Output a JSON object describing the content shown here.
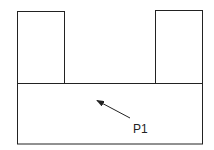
{
  "diagram": {
    "label": "P1",
    "stroke_color": "#222222",
    "shapes": {
      "left_tower": {
        "x": 17,
        "y": 11,
        "w": 47,
        "h": 72
      },
      "right_tower": {
        "x": 155,
        "y": 10,
        "w": 47,
        "h": 73
      },
      "base": {
        "x": 17,
        "y": 83,
        "w": 185,
        "h": 61
      }
    },
    "arrow": {
      "from": [
        130,
        118
      ],
      "to": [
        96,
        100
      ]
    }
  }
}
